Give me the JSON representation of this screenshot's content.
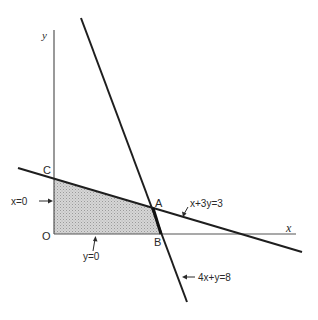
{
  "diagram": {
    "type": "linear-programming-feasible-region",
    "axes": {
      "x_label": "x",
      "y_label": "y",
      "origin_label": "O"
    },
    "points": {
      "A": "A",
      "B": "B",
      "C": "C",
      "O": "O"
    },
    "constraints": [
      {
        "id": "line1",
        "label": "x+3y=3"
      },
      {
        "id": "line2",
        "label": "4x+y=8"
      },
      {
        "id": "xzero",
        "label": "x=0"
      },
      {
        "id": "yzero",
        "label": "y=0"
      }
    ],
    "feasible_region": {
      "vertices": [
        "O",
        "C",
        "A",
        "B"
      ],
      "fill": "#c8c8c8"
    },
    "colors": {
      "line": "#1e1e1e",
      "axis": "#555555",
      "shade": "#c8c8c8"
    }
  }
}
